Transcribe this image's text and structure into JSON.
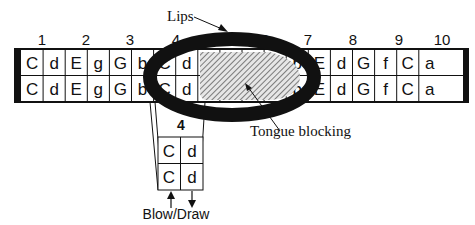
{
  "labels": {
    "lips": "Lips",
    "tongue_blocking": "Tongue blocking",
    "blow_draw": "Blow/Draw",
    "inset_hole": "4"
  },
  "hole_numbers": [
    "1",
    "2",
    "3",
    "4",
    "5",
    "6",
    "7",
    "8",
    "9",
    "10"
  ],
  "cells": {
    "top_row": [
      "C",
      "d",
      "E",
      "g",
      "G",
      "b",
      "C",
      "d",
      "",
      "",
      "",
      "",
      "b",
      "E",
      "d",
      "G",
      "f",
      "C",
      "a"
    ],
    "bottom_row": [
      "C",
      "d",
      "E",
      "g",
      "G",
      "b",
      "C",
      "d",
      "",
      "",
      "",
      "",
      "b",
      "E",
      "d",
      "G",
      "f",
      "C",
      "a"
    ]
  },
  "inset": {
    "top": [
      "C",
      "d"
    ],
    "bottom": [
      "C",
      "d"
    ]
  },
  "colors": {
    "ink": "#111111",
    "background": "#ffffff",
    "hatch_bg": "#dcdcdc"
  }
}
